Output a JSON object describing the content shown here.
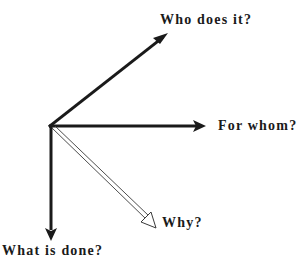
{
  "diagram": {
    "type": "vector-axes",
    "origin": {
      "x": 50,
      "y": 126
    },
    "axes": [
      {
        "id": "who",
        "label": "Who does it?",
        "style": "solid",
        "tip": {
          "x": 167,
          "y": 34
        }
      },
      {
        "id": "whom",
        "label": "For whom?",
        "style": "solid",
        "tip": {
          "x": 205,
          "y": 126
        }
      },
      {
        "id": "why",
        "label": "Why?",
        "style": "hollow",
        "tip": {
          "x": 155,
          "y": 228
        }
      },
      {
        "id": "what",
        "label": "What is done?",
        "style": "solid",
        "tip": {
          "x": 51,
          "y": 240
        }
      }
    ],
    "colors": {
      "stroke": "#1a1a1a",
      "background": "#ffffff"
    }
  }
}
